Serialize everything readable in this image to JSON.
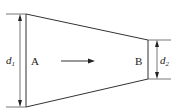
{
  "diagram": {
    "type": "tapered-pipe-flow",
    "labels": {
      "section_a": "A",
      "section_b": "B",
      "diameter_1_base": "d",
      "diameter_1_sub": "1",
      "diameter_2_base": "d",
      "diameter_2_sub": "2"
    },
    "flow_direction": "left-to-right",
    "colors": {
      "line": "#333333",
      "background": "#ffffff"
    }
  }
}
